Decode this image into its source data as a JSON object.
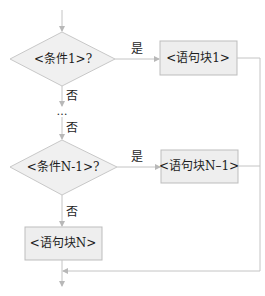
{
  "diagram": {
    "type": "flowchart",
    "title": "",
    "colors": {
      "line": "#c4c4c4",
      "diamond_fill": "#f0f0f0",
      "diamond_stroke": "#c8c8c8",
      "box_fill": "#eeeeee",
      "box_stroke": "#bdbdbd",
      "text": "#1e1e1e"
    },
    "nodes": [
      {
        "id": "cond1",
        "shape": "diamond",
        "label": "<条件1>?"
      },
      {
        "id": "block1",
        "shape": "rect",
        "label": "<语句块1>"
      },
      {
        "id": "ellipsis",
        "shape": "text",
        "label": "…"
      },
      {
        "id": "condN1",
        "shape": "diamond",
        "label": "<条件N-1>?"
      },
      {
        "id": "blockN1",
        "shape": "rect",
        "label": "<语句块N–1>"
      },
      {
        "id": "blockN",
        "shape": "rect",
        "label": "<语句块N>"
      }
    ],
    "edges": [
      {
        "from": "start",
        "to": "cond1",
        "label": ""
      },
      {
        "from": "cond1",
        "to": "block1",
        "label": "是"
      },
      {
        "from": "cond1",
        "to": "ellipsis",
        "label": "否"
      },
      {
        "from": "ellipsis",
        "to": "condN1",
        "label": "否"
      },
      {
        "from": "condN1",
        "to": "blockN1",
        "label": "是"
      },
      {
        "from": "condN1",
        "to": "blockN",
        "label": "否"
      },
      {
        "from": "block1",
        "to": "merge",
        "label": ""
      },
      {
        "from": "blockN1",
        "to": "merge",
        "label": ""
      },
      {
        "from": "blockN",
        "to": "end",
        "label": ""
      }
    ],
    "labels": {
      "yes": "是",
      "no": "否"
    }
  }
}
